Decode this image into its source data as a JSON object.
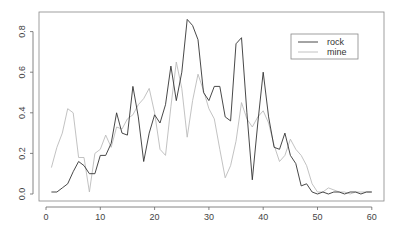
{
  "chart_data": {
    "type": "line",
    "title": "",
    "xlabel": "",
    "ylabel": "",
    "xlim": [
      0,
      60
    ],
    "ylim": [
      0,
      0.86
    ],
    "x_ticks": [
      0,
      10,
      20,
      30,
      40,
      50,
      60
    ],
    "y_ticks": [
      0.0,
      0.2,
      0.4,
      0.6,
      0.8
    ],
    "x_tick_labels": [
      "0",
      "10",
      "20",
      "30",
      "40",
      "50",
      "60"
    ],
    "y_tick_labels": [
      "0.0",
      "0.2",
      "0.4",
      "0.6",
      "0.8"
    ],
    "grid": false,
    "legend_position": "top-right",
    "x": [
      1,
      2,
      3,
      4,
      5,
      6,
      7,
      8,
      9,
      10,
      11,
      12,
      13,
      14,
      15,
      16,
      17,
      18,
      19,
      20,
      21,
      22,
      23,
      24,
      25,
      26,
      27,
      28,
      29,
      30,
      31,
      32,
      33,
      34,
      35,
      36,
      37,
      38,
      39,
      40,
      41,
      42,
      43,
      44,
      45,
      46,
      47,
      48,
      49,
      50,
      51,
      52,
      53,
      54,
      55,
      56,
      57,
      58,
      59,
      60
    ],
    "series": [
      {
        "name": "rock",
        "color": "#333333",
        "values": [
          0.01,
          0.01,
          0.03,
          0.05,
          0.11,
          0.16,
          0.14,
          0.1,
          0.1,
          0.19,
          0.19,
          0.25,
          0.4,
          0.3,
          0.29,
          0.53,
          0.38,
          0.16,
          0.3,
          0.39,
          0.35,
          0.44,
          0.63,
          0.46,
          0.6,
          0.86,
          0.83,
          0.76,
          0.5,
          0.46,
          0.53,
          0.53,
          0.38,
          0.36,
          0.74,
          0.77,
          0.4,
          0.07,
          0.35,
          0.6,
          0.38,
          0.23,
          0.22,
          0.3,
          0.19,
          0.15,
          0.04,
          0.05,
          0.01,
          0.0,
          0.01,
          0.0,
          0.01,
          0.01,
          0.0,
          0.01,
          0.01,
          0.0,
          0.01,
          0.01
        ]
      },
      {
        "name": "mine",
        "color": "#bbbbbb",
        "values": [
          0.13,
          0.23,
          0.3,
          0.42,
          0.4,
          0.18,
          0.18,
          0.01,
          0.2,
          0.22,
          0.29,
          0.23,
          0.33,
          0.32,
          0.37,
          0.39,
          0.44,
          0.47,
          0.52,
          0.4,
          0.22,
          0.19,
          0.43,
          0.65,
          0.52,
          0.28,
          0.46,
          0.59,
          0.51,
          0.42,
          0.37,
          0.22,
          0.08,
          0.14,
          0.26,
          0.45,
          0.37,
          0.33,
          0.38,
          0.41,
          0.35,
          0.24,
          0.16,
          0.19,
          0.27,
          0.22,
          0.19,
          0.14,
          0.05,
          0.01,
          0.01,
          0.03,
          0.02,
          0.01,
          0.01,
          0.0,
          0.01,
          0.01,
          0.01,
          0.01
        ]
      }
    ]
  },
  "legend": {
    "items": [
      {
        "label": "rock",
        "color": "#333333"
      },
      {
        "label": "mine",
        "color": "#bbbbbb"
      }
    ]
  }
}
